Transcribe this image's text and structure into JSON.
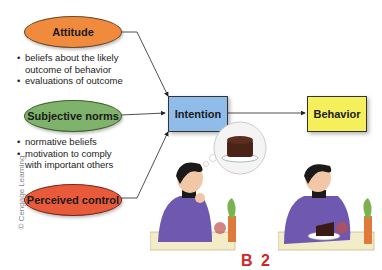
{
  "factors": [
    {
      "label": "Attitude",
      "color": "#f08a3c",
      "bullets": [
        "beliefs about the likely",
        "outcome of behavior",
        "evaluations of outcome"
      ]
    },
    {
      "label": "Subjective norms",
      "color": "#7fb26a",
      "bullets": [
        "normative beliefs",
        "motivation to comply",
        "with important others"
      ]
    },
    {
      "label": "Perceived control",
      "color": "#e95a3a",
      "bullets": []
    }
  ],
  "intention": {
    "label": "Intention",
    "color": "#8fbce8"
  },
  "behavior": {
    "label": "Behavior",
    "color": "#f4ef5a"
  },
  "credit": "© Cengage Learning",
  "figure_label": "B 2",
  "illustrations": {
    "thinking": "woman-thinking-about-cake",
    "eating": "woman-eating-cake"
  }
}
